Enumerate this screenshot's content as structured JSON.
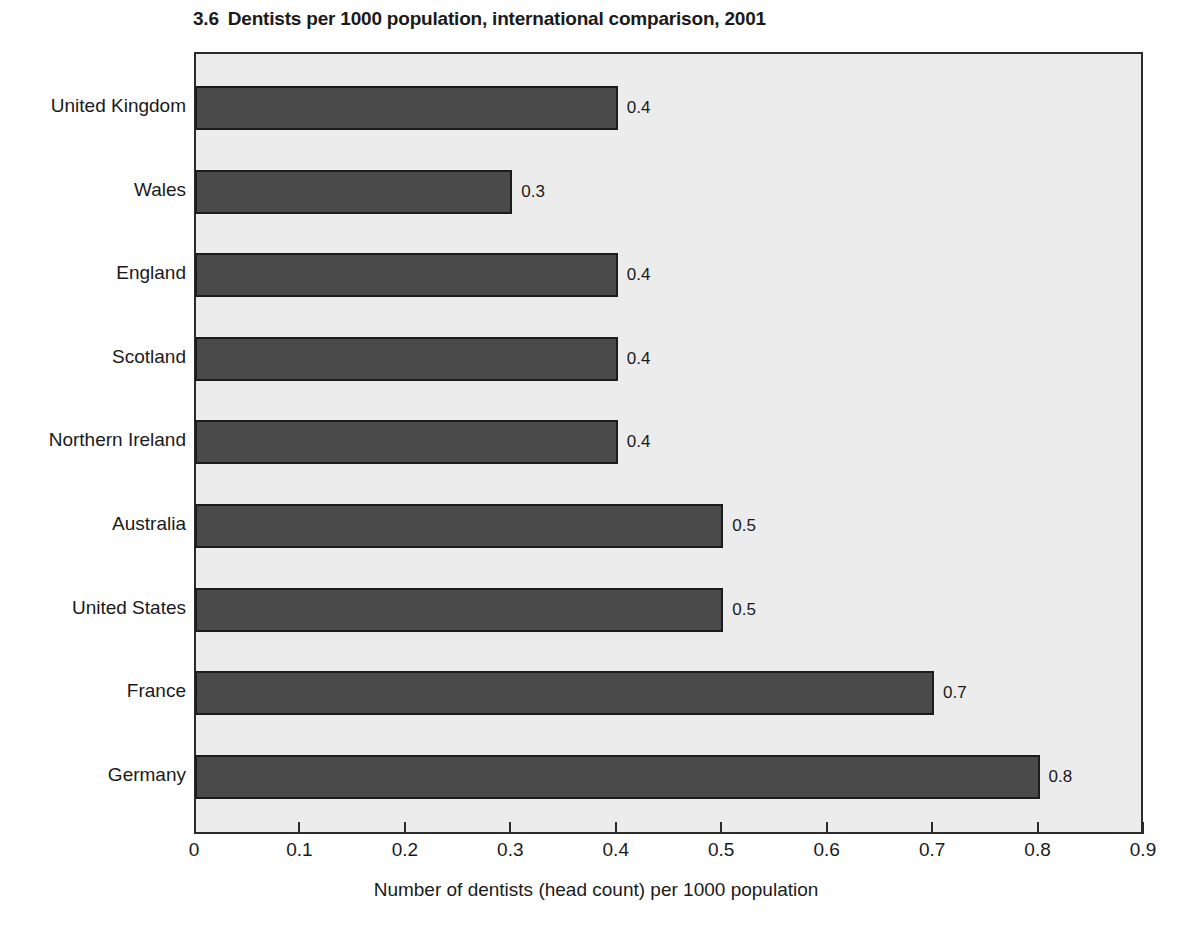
{
  "figure": {
    "number": "3.6",
    "title": "Dentists per 1000 population, international comparison, 2001"
  },
  "axis": {
    "x_title": "Number of dentists (head count) per 1000 population"
  },
  "colors": {
    "bar_fill": "#4a4a4a",
    "bar_border": "#1c1c1c",
    "plot_background": "#ececec",
    "frame": "#2b2b2b",
    "text": "#1a1a1a"
  },
  "chart_data": {
    "type": "bar",
    "orientation": "horizontal",
    "xlabel": "Number of dentists (head count) per 1000 population",
    "ylabel": "",
    "xlim": [
      0,
      0.9
    ],
    "xticks": [
      "0",
      "0.1",
      "0.2",
      "0.3",
      "0.4",
      "0.5",
      "0.6",
      "0.7",
      "0.8",
      "0.9"
    ],
    "xtick_values": [
      0,
      0.1,
      0.2,
      0.3,
      0.4,
      0.5,
      0.6,
      0.7,
      0.8,
      0.9
    ],
    "grid": false,
    "legend": "none",
    "categories": [
      "United Kingdom",
      "Wales",
      "England",
      "Scotland",
      "Northern Ireland",
      "Australia",
      "United States",
      "France",
      "Germany"
    ],
    "values": [
      0.4,
      0.3,
      0.4,
      0.4,
      0.4,
      0.5,
      0.5,
      0.7,
      0.8
    ],
    "data_labels": [
      "0.4",
      "0.3",
      "0.4",
      "0.4",
      "0.4",
      "0.5",
      "0.5",
      "0.7",
      "0.8"
    ]
  }
}
